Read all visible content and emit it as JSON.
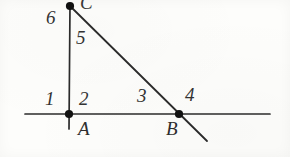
{
  "figure": {
    "type": "geometry-diagram",
    "background_color": "#fdfdfb",
    "line_color": "#2b2b2b",
    "point_color": "#111111",
    "canvas": {
      "width": 290,
      "height": 157
    },
    "points": [
      {
        "name": "C",
        "label": "C",
        "x": 70,
        "y": 5,
        "label_x": 80,
        "label_y": -6,
        "visible_label": "partial"
      },
      {
        "name": "A",
        "label": "A",
        "x": 69,
        "y": 114,
        "label_x": 78,
        "label_y": 119
      },
      {
        "name": "B",
        "label": "B",
        "x": 179,
        "y": 114,
        "label_x": 166,
        "label_y": 119
      }
    ],
    "lines": [
      {
        "name": "horizontal-line",
        "x1": 25,
        "y1": 114,
        "x2": 270,
        "y2": 114
      },
      {
        "name": "vertical-line",
        "x1": 70,
        "y1": 5,
        "x2": 69,
        "y2": 129
      },
      {
        "name": "slanted-line",
        "x1": 70,
        "y1": 6,
        "x2": 207,
        "y2": 141
      }
    ],
    "angle_labels": [
      {
        "id": "1",
        "text": "1",
        "x": 45,
        "y": 89
      },
      {
        "id": "2",
        "text": "2",
        "x": 79,
        "y": 89
      },
      {
        "id": "3",
        "text": "3",
        "x": 137,
        "y": 86
      },
      {
        "id": "4",
        "text": "4",
        "x": 185,
        "y": 85
      },
      {
        "id": "5",
        "text": "5",
        "x": 76,
        "y": 28
      },
      {
        "id": "6",
        "text": "6",
        "x": 46,
        "y": 6
      }
    ]
  }
}
